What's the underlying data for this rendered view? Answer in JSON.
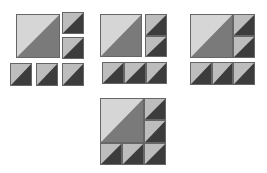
{
  "diagram": {
    "colors": {
      "big_light": "#d6d6d6",
      "big_dark": "#7a7a7a",
      "small_light": "#bdbdbd",
      "small_dark": "#3c3c3c",
      "border": "#666666"
    },
    "steps": [
      {
        "label": "Step 1: separate pieces",
        "tiles": [
          {
            "kind": "big",
            "x": 16,
            "y": 14,
            "w": 44,
            "h": 44
          },
          {
            "kind": "small",
            "x": 62,
            "y": 12,
            "w": 22,
            "h": 22
          },
          {
            "kind": "small",
            "x": 62,
            "y": 37,
            "w": 22,
            "h": 22
          },
          {
            "kind": "small",
            "x": 10,
            "y": 63,
            "w": 22,
            "h": 23
          },
          {
            "kind": "small",
            "x": 36,
            "y": 63,
            "w": 22,
            "h": 23
          },
          {
            "kind": "small",
            "x": 62,
            "y": 63,
            "w": 22,
            "h": 23
          }
        ]
      },
      {
        "label": "Step 2: join columns and rows",
        "tiles": [
          {
            "kind": "big",
            "x": 100,
            "y": 14,
            "w": 42,
            "h": 43
          },
          {
            "kind": "small",
            "x": 145,
            "y": 14,
            "w": 22,
            "h": 22
          },
          {
            "kind": "small",
            "x": 145,
            "y": 36,
            "w": 22,
            "h": 21
          },
          {
            "kind": "small",
            "x": 102,
            "y": 62,
            "w": 22,
            "h": 22
          },
          {
            "kind": "small",
            "x": 124,
            "y": 62,
            "w": 22,
            "h": 22
          },
          {
            "kind": "small",
            "x": 146,
            "y": 62,
            "w": 21,
            "h": 22
          }
        ]
      },
      {
        "label": "Step 3: attach column",
        "tiles": [
          {
            "kind": "big",
            "x": 190,
            "y": 14,
            "w": 43,
            "h": 44
          },
          {
            "kind": "small",
            "x": 233,
            "y": 14,
            "w": 22,
            "h": 22
          },
          {
            "kind": "small",
            "x": 233,
            "y": 36,
            "w": 22,
            "h": 22
          },
          {
            "kind": "small",
            "x": 190,
            "y": 62,
            "w": 22,
            "h": 23
          },
          {
            "kind": "small",
            "x": 212,
            "y": 62,
            "w": 21,
            "h": 23
          },
          {
            "kind": "small",
            "x": 233,
            "y": 62,
            "w": 22,
            "h": 23
          }
        ]
      },
      {
        "label": "Step 4: finished block",
        "tiles": [
          {
            "kind": "big",
            "x": 100,
            "y": 98,
            "w": 44,
            "h": 45
          },
          {
            "kind": "small",
            "x": 144,
            "y": 98,
            "w": 22,
            "h": 22
          },
          {
            "kind": "small",
            "x": 144,
            "y": 120,
            "w": 22,
            "h": 23
          },
          {
            "kind": "small",
            "x": 100,
            "y": 143,
            "w": 22,
            "h": 22
          },
          {
            "kind": "small",
            "x": 122,
            "y": 143,
            "w": 22,
            "h": 22
          },
          {
            "kind": "small",
            "x": 144,
            "y": 143,
            "w": 22,
            "h": 22
          }
        ]
      }
    ]
  }
}
